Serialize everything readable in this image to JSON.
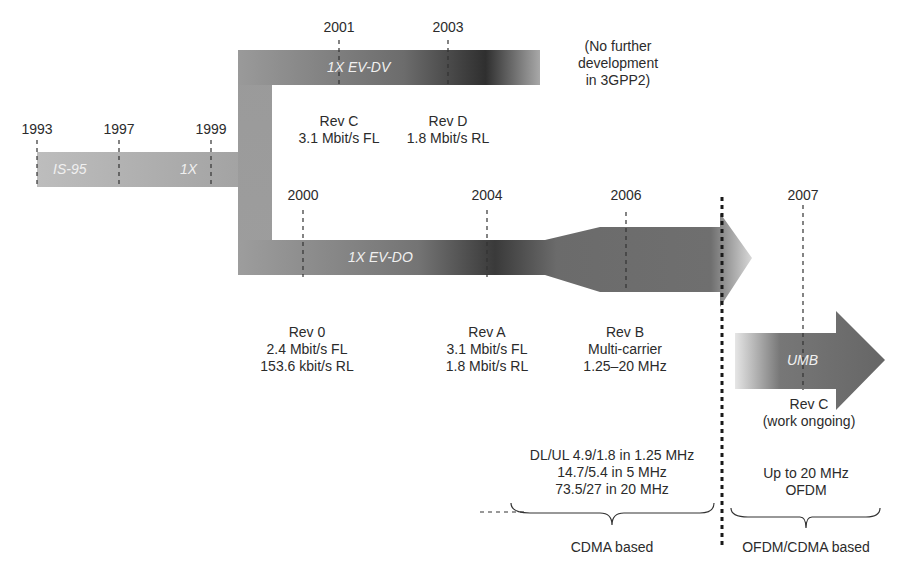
{
  "years": {
    "y1993": "1993",
    "y1997": "1997",
    "y1999": "1999",
    "y2000": "2000",
    "y2001": "2001",
    "y2003": "2003",
    "y2004": "2004",
    "y2006": "2006",
    "y2007": "2007"
  },
  "bars": {
    "is95": "IS-95",
    "onex": "1X",
    "evdv": "1X EV-DV",
    "evdo": "1X EV-DO",
    "umb": "UMB"
  },
  "evdv_note": {
    "line1": "(No further",
    "line2": "development",
    "line3": "in 3GPP2)"
  },
  "evdv_revisions": [
    {
      "title": "Rev C",
      "detail": "3.1 Mbit/s FL"
    },
    {
      "title": "Rev D",
      "detail": "1.8 Mbit/s RL"
    }
  ],
  "evdo_revisions": [
    {
      "title": "Rev 0",
      "line1": "2.4 Mbit/s FL",
      "line2": "153.6 kbit/s RL"
    },
    {
      "title": "Rev A",
      "line1": "3.1 Mbit/s FL",
      "line2": "1.8 Mbit/s RL"
    },
    {
      "title": "Rev B",
      "line1": "Multi-carrier",
      "line2": "1.25–20 MHz"
    }
  ],
  "umb_revision": {
    "title": "Rev C",
    "detail": "(work ongoing)"
  },
  "cdma_rates": {
    "line1": "DL/UL 4.9/1.8 in 1.25 MHz",
    "line2": "14.7/5.4 in 5 MHz",
    "line3": "73.5/27 in 20 MHz"
  },
  "ofdm_note": {
    "line1": "Up to 20 MHz",
    "line2": "OFDM"
  },
  "groups": {
    "cdma": "CDMA based",
    "ofdm": "OFDM/CDMA based"
  },
  "colors": {
    "bar_light": "#b4b4b4",
    "bar_mid": "#8c8c8c",
    "bar_dark": "#3a3a3a",
    "text": "#2b2b2b",
    "bar_text": "#f0f0f0"
  }
}
